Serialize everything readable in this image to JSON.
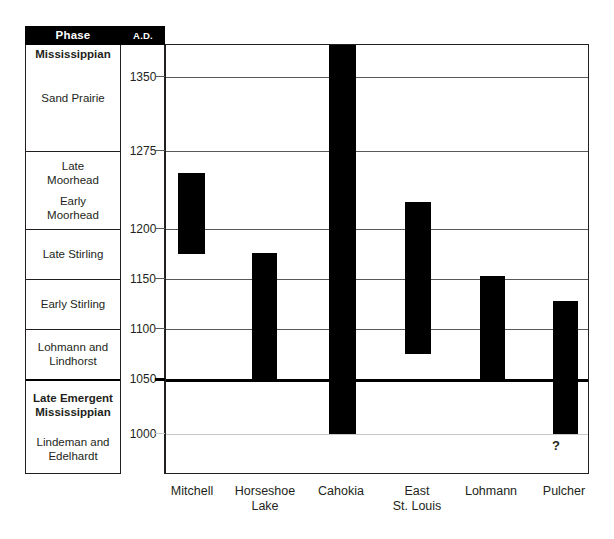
{
  "table": {
    "header_phase": "Phase",
    "header_ad": "A.D."
  },
  "phases": [
    {
      "lines": [
        "Mississippian"
      ],
      "bold": true,
      "top": 44,
      "bottom": 150,
      "align": "top"
    },
    {
      "lines": [
        "Sand Prairie"
      ],
      "bold": false,
      "top": 44,
      "bottom": 150,
      "align": "center"
    },
    {
      "lines": [
        "Late",
        "Moorhead"
      ],
      "bold": false,
      "top": 150,
      "bottom": 228,
      "align": "upper"
    },
    {
      "lines": [
        "Early",
        "Moorhead"
      ],
      "bold": false,
      "top": 150,
      "bottom": 228,
      "align": "lower"
    },
    {
      "lines": [
        "Late Stirling"
      ],
      "bold": false,
      "top": 228,
      "bottom": 278,
      "align": "center"
    },
    {
      "lines": [
        "Early Stirling"
      ],
      "bold": false,
      "top": 278,
      "bottom": 328,
      "align": "center"
    },
    {
      "lines": [
        "Lohmann and",
        "Lindhorst"
      ],
      "bold": false,
      "top": 328,
      "bottom": 378,
      "align": "center"
    },
    {
      "lines": [
        "Late Emergent",
        "Mississippian"
      ],
      "bold": true,
      "top": 378,
      "bottom": 474,
      "align": "upper"
    },
    {
      "lines": [
        "Lindeman and",
        "Edelhardt"
      ],
      "bold": false,
      "top": 378,
      "bottom": 474,
      "align": "lower"
    }
  ],
  "phase_dividers": [
    {
      "y": 150,
      "thick": false
    },
    {
      "y": 228,
      "thick": false
    },
    {
      "y": 278,
      "thick": false
    },
    {
      "y": 328,
      "thick": false
    },
    {
      "y": 378,
      "thick": true
    }
  ],
  "chart_data": {
    "type": "bar",
    "orientation": "vertical-range",
    "title": "",
    "xlabel": "",
    "ylabel": "A.D.",
    "ylim": [
      960,
      1390
    ],
    "grid": true,
    "legend": null,
    "yticks": [
      1350,
      1275,
      1200,
      1150,
      1100,
      1050,
      1000
    ],
    "ytick_labels": [
      "1350",
      "1275",
      "1200",
      "1150",
      "1100",
      "1050",
      "1000"
    ],
    "emphasized_ytick": 1050,
    "categories": [
      "Mitchell",
      "Horseshoe Lake",
      "Cahokia",
      "East St. Louis",
      "Lohmann",
      "Pulcher"
    ],
    "category_label_lines": [
      [
        "Mitchell"
      ],
      [
        "Horseshoe",
        "Lake"
      ],
      [
        "Cahokia"
      ],
      [
        "East",
        "St. Louis"
      ],
      [
        "Lohmann"
      ],
      [
        "Pulcher"
      ]
    ],
    "series": [
      {
        "name": "Occupation span (A.D.)",
        "ranges": [
          {
            "category": "Mitchell",
            "start": 1150,
            "end": 1250,
            "uncertain": false
          },
          {
            "category": "Horseshoe Lake",
            "start": 1050,
            "end": 1175,
            "uncertain": false
          },
          {
            "category": "Cahokia",
            "start": 1000,
            "end": 1380,
            "uncertain": false
          },
          {
            "category": "East St. Louis",
            "start": 1080,
            "end": 1220,
            "uncertain": false
          },
          {
            "category": "Lohmann",
            "start": 1050,
            "end": 1152,
            "uncertain": false
          },
          {
            "category": "Pulcher",
            "start": 1000,
            "end": 1127,
            "uncertain": true
          }
        ]
      }
    ],
    "annotations": [
      {
        "text": "?",
        "category": "Pulcher",
        "value": 985
      }
    ]
  },
  "bars": [
    {
      "name": "mitchell",
      "left": 12,
      "width": 27,
      "top": 172,
      "bottom": 253
    },
    {
      "name": "horseshoe-lake",
      "left": 86,
      "width": 25,
      "top": 252,
      "bottom": 379
    },
    {
      "name": "cahokia",
      "left": 163,
      "width": 27,
      "top": 44,
      "bottom": 433
    },
    {
      "name": "east-st-louis",
      "left": 239,
      "width": 26,
      "top": 201,
      "bottom": 353
    },
    {
      "name": "lohmann",
      "left": 314,
      "width": 25,
      "top": 275,
      "bottom": 379
    },
    {
      "name": "pulcher",
      "left": 387,
      "width": 25,
      "top": 300,
      "bottom": 433
    }
  ],
  "gridlines": [
    {
      "y": 32,
      "style": "normal"
    },
    {
      "y": 106,
      "style": "normal"
    },
    {
      "y": 184,
      "style": "normal"
    },
    {
      "y": 234,
      "style": "normal"
    },
    {
      "y": 284,
      "style": "normal"
    },
    {
      "y": 334,
      "style": "thick"
    },
    {
      "y": 389,
      "style": "faint"
    }
  ],
  "yticks": [
    {
      "label": "1350",
      "y": 69
    },
    {
      "label": "1275",
      "y": 143
    },
    {
      "label": "1200",
      "y": 221
    },
    {
      "label": "1150",
      "y": 271
    },
    {
      "label": "1100",
      "y": 321
    },
    {
      "label": "1050",
      "y": 371
    },
    {
      "label": "1000",
      "y": 426
    }
  ],
  "xlabels": [
    {
      "lines": [
        "Mitchell"
      ],
      "center": 192
    },
    {
      "lines": [
        "Horseshoe",
        "Lake"
      ],
      "center": 265
    },
    {
      "lines": [
        "Cahokia"
      ],
      "center": 341
    },
    {
      "lines": [
        "East",
        "St. Louis"
      ],
      "center": 417
    },
    {
      "lines": [
        "Lohmann"
      ],
      "center": 491
    },
    {
      "lines": [
        "Pulcher"
      ],
      "center": 564
    }
  ],
  "qmark": {
    "text": "?",
    "left": 552,
    "top": 438
  }
}
